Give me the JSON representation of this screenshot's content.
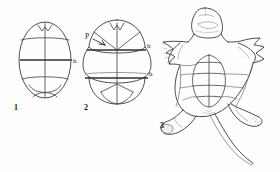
{
  "plate": {
    "title": "Turtle plastron outline figures",
    "background_color": "#fefefe",
    "ink_color": "#3a3a3a",
    "width": 280,
    "height": 172
  },
  "figures": [
    {
      "number": "1",
      "caption_x": 14,
      "caption_y": 110,
      "description": "oval plastron outline with transverse seams",
      "labels": [
        {
          "text": "h",
          "x": 73,
          "y": 62,
          "name": "hinge-label-fig1"
        }
      ]
    },
    {
      "number": "2",
      "caption_x": 84,
      "caption_y": 110,
      "description": "lobed plastron outline with two hinges",
      "labels": [
        {
          "text": "P",
          "x": 87,
          "y": 37,
          "name": "pectoral-label-fig2"
        },
        {
          "text": "h",
          "x": 146,
          "y": 45,
          "name": "hinge-label-fig2-upper"
        },
        {
          "text": "h",
          "x": 146,
          "y": 73,
          "name": "hinge-label-fig2-lower"
        }
      ]
    },
    {
      "number": "3",
      "caption_x": 160,
      "caption_y": 128,
      "description": "ventral view of whole turtle showing plastron, limbs, head and tail",
      "labels": []
    }
  ],
  "legend": {
    "h_meaning": "h",
    "p_meaning": "P"
  }
}
